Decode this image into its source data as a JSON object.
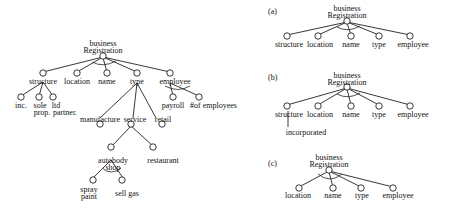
{
  "colors": {
    "line": "#222222",
    "text": "#111111",
    "background": "#ffffff"
  },
  "left_tree": {
    "root": {
      "line1": "business",
      "line2": "Registration"
    },
    "children": {
      "structure": "structure",
      "location": "location",
      "name": "name",
      "type": "type",
      "employee": "employee"
    },
    "structure_children": {
      "inc": "inc.",
      "sole_1": "sole",
      "sole_2": "prop.",
      "ltd_1": "ltd",
      "ltd_2": "partner."
    },
    "employee_children": {
      "payroll": "payroll",
      "num_employees": "#of employees"
    },
    "type_children": {
      "manufacture": "manufacture",
      "service": "service",
      "retail": "retail"
    },
    "service_children": {
      "autobody_1": "autobody",
      "autobody_2": "shop",
      "restaurant": "restaurant"
    },
    "autobody_children": {
      "spray_1": "spray",
      "spray_2": "paint",
      "sell_gas": "sell gas"
    }
  },
  "panel_a": {
    "label": "(a)",
    "root": {
      "line1": "business",
      "line2": "Registration"
    },
    "children": [
      "structure",
      "location",
      "name",
      "type",
      "employee"
    ]
  },
  "panel_b": {
    "label": "(b)",
    "root": {
      "line1": "business",
      "line2": "Registration"
    },
    "children": [
      "structure",
      "location",
      "name",
      "type",
      "employee"
    ],
    "structure_child": "incorporated"
  },
  "panel_c": {
    "label": "(c)",
    "root": {
      "line1": "business",
      "line2": "Registration"
    },
    "children": [
      "location",
      "name",
      "type",
      "employee"
    ]
  }
}
